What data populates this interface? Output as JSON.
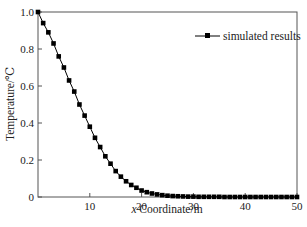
{
  "chart_data": {
    "type": "line",
    "title": "",
    "xlabel": "x Coordinate/m",
    "xlabel_italic_part": "x",
    "xlabel_rest": " Coordinate/m",
    "ylabel": "Temperature/℃",
    "xlim": [
      0,
      50
    ],
    "ylim": [
      0,
      1.0
    ],
    "x_ticks": [
      10,
      20,
      30,
      40,
      50
    ],
    "x_tick_labels": [
      "10",
      "20",
      "30",
      "40",
      "50"
    ],
    "y_ticks": [
      0,
      0.2,
      0.4,
      0.6,
      0.8,
      1.0
    ],
    "y_tick_labels": [
      "0",
      "0.2",
      "0.4",
      "0.6",
      "0.8",
      "1.0"
    ],
    "grid": false,
    "legend_position": "upper right",
    "series": [
      {
        "name": "simulated results",
        "marker": "square",
        "color": "#000000",
        "x": [
          0,
          1,
          2,
          3,
          4,
          5,
          6,
          7,
          8,
          9,
          10,
          11,
          12,
          13,
          14,
          15,
          16,
          17,
          18,
          19,
          20,
          21,
          22,
          23,
          24,
          25,
          26,
          27,
          28,
          29,
          30,
          31,
          32,
          33,
          34,
          35,
          36,
          37,
          38,
          39,
          40,
          41,
          42,
          43,
          44,
          45,
          46,
          47,
          48,
          49,
          50
        ],
        "values": [
          1.0,
          0.94,
          0.89,
          0.83,
          0.76,
          0.7,
          0.63,
          0.57,
          0.5,
          0.44,
          0.38,
          0.32,
          0.27,
          0.22,
          0.18,
          0.14,
          0.11,
          0.085,
          0.065,
          0.05,
          0.035,
          0.026,
          0.019,
          0.014,
          0.01,
          0.007,
          0.005,
          0.004,
          0.003,
          0.002,
          0.002,
          0.001,
          0.001,
          0.001,
          0.001,
          0.001,
          0.0,
          0.0,
          0.0,
          0.0,
          0.0,
          0.0,
          0.0,
          0.0,
          0.0,
          0.0,
          0.0,
          0.0,
          0.0,
          0.0,
          0.0
        ]
      }
    ]
  }
}
